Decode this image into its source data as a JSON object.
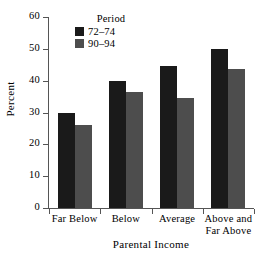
{
  "chart_data": {
    "type": "bar",
    "title": "",
    "subtitle": "",
    "xlabel": "Parental Income",
    "ylabel": "Percent",
    "categories": [
      "Far Below",
      "Below",
      "Average",
      "Above and Far Above"
    ],
    "category_lines": [
      [
        "Far Below"
      ],
      [
        "Below"
      ],
      [
        "Average"
      ],
      [
        "Above and",
        "Far Above"
      ]
    ],
    "series": [
      {
        "name": "72–74",
        "color": "#1a1a1a",
        "values": [
          30.0,
          40.0,
          44.5,
          50.0
        ]
      },
      {
        "name": "90–94",
        "color": "#4d4d4d",
        "values": [
          26.2,
          36.4,
          34.6,
          43.7
        ]
      }
    ],
    "legend": {
      "title": "Period",
      "position": "top-left-inside",
      "entries": [
        {
          "label": "72–74",
          "color": "#1a1a1a"
        },
        {
          "label": "90–94",
          "color": "#4d4d4d"
        }
      ]
    },
    "ylim": [
      0,
      60
    ],
    "ytick_step": 10,
    "ytick_labels": [
      "0",
      "10",
      "20",
      "30",
      "40",
      "50",
      "60"
    ],
    "ytick_values": [
      0,
      10,
      20,
      30,
      40,
      50,
      60
    ],
    "xlim_groups": 4,
    "grid": false,
    "axis_color": "#555555",
    "background": "#ffffff"
  }
}
